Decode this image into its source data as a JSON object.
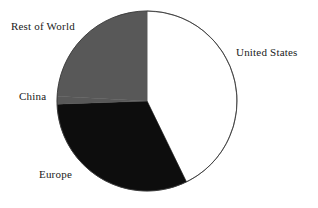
{
  "chart_data": {
    "type": "pie",
    "title": "",
    "subtitle": "",
    "xlabel": "",
    "ylabel": "",
    "legend_position": "none",
    "grid": false,
    "labels_position": "outside",
    "start_angle_deg": 0,
    "direction": "clockwise",
    "categories": [
      "United States",
      "Europe",
      "China",
      "Rest of World"
    ],
    "values": [
      42.8,
      31.7,
      1.4,
      24.1
    ],
    "colors": [
      "#ffffff",
      "#0d0d0d",
      "#585858",
      "#585858"
    ],
    "slices": [
      {
        "label": "United States",
        "value": 42.8,
        "color": "#ffffff",
        "start_deg": 0,
        "end_deg": 154
      },
      {
        "label": "Europe",
        "value": 31.7,
        "color": "#0d0d0d",
        "start_deg": 154,
        "end_deg": 268
      },
      {
        "label": "China",
        "value": 1.4,
        "color": "#585858",
        "start_deg": 268,
        "end_deg": 273
      },
      {
        "label": "Rest of World",
        "value": 24.1,
        "color": "#585858",
        "start_deg": 273,
        "end_deg": 360
      }
    ]
  },
  "labels": {
    "rest_of_world": "Rest of World",
    "united_states": "United States",
    "china": "China",
    "europe": "Europe"
  },
  "style": {
    "background": "#ffffff",
    "outline_color": "#3a3a3a",
    "gray_fill": "#585858",
    "black_fill": "#0d0d0d",
    "white_fill": "#ffffff",
    "text_color": "#1a1a1a"
  },
  "geometry": {
    "center_x": 147,
    "center_y": 101,
    "radius": 90
  }
}
